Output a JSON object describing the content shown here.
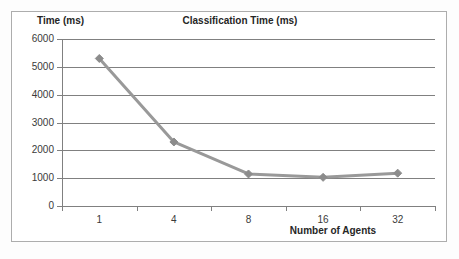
{
  "chart_data": {
    "type": "line",
    "title": "Classification Time (ms)",
    "xlabel": "Number of Agents",
    "ylabel": "Time (ms)",
    "categories": [
      "1",
      "4",
      "8",
      "16",
      "32"
    ],
    "values": [
      5300,
      2300,
      1150,
      1030,
      1180
    ],
    "series": [
      {
        "name": "Classification Time (ms)",
        "values": [
          5300,
          2300,
          1150,
          1030,
          1180
        ]
      }
    ],
    "ylim": [
      0,
      6000
    ],
    "y_ticks": [
      "0",
      "1000",
      "2000",
      "3000",
      "4000",
      "5000",
      "6000"
    ],
    "y_tick_values": [
      0,
      1000,
      2000,
      3000,
      4000,
      5000,
      6000
    ],
    "grid": true,
    "legend": "none",
    "marker": "diamond",
    "colors": {
      "series_line": "#999999",
      "marker": "#8c8c8c",
      "gridline": "#808080",
      "axis": "#808080",
      "text": "#262626",
      "tick_text": "#3a3a3a",
      "frame": "#adadad",
      "background": "#ffffff"
    }
  }
}
